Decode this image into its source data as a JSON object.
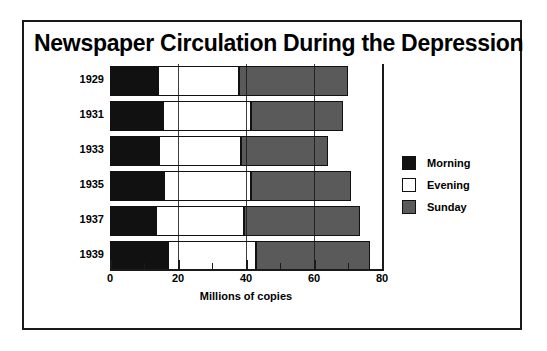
{
  "figure": {
    "title": "Newspaper Circulation During the Depression"
  },
  "legend": {
    "position": "right",
    "items": [
      {
        "label": "Morning",
        "color": "#111111",
        "swatch": "morning"
      },
      {
        "label": "Evening",
        "color": "#ffffff",
        "swatch": "evening"
      },
      {
        "label": "Sunday",
        "color": "#5a5a5a",
        "swatch": "sunday"
      }
    ]
  },
  "axis": {
    "x_title": "Millions of copies",
    "tick_labels": [
      "0",
      "20",
      "40",
      "60",
      "80"
    ],
    "tick_values": [
      0,
      20,
      40,
      60,
      80
    ],
    "minor_tick_values": [
      10,
      30,
      50,
      70
    ]
  },
  "chart_data": {
    "type": "bar",
    "orientation": "horizontal",
    "stacked": true,
    "title": "Newspaper Circulation During the Depression",
    "xlabel": "Millions of copies",
    "ylabel": "",
    "xlim": [
      0,
      80
    ],
    "grid": false,
    "legend_position": "right",
    "categories": [
      "1929",
      "1931",
      "1933",
      "1935",
      "1937",
      "1939"
    ],
    "series": [
      {
        "name": "Morning",
        "color": "#111111",
        "values": [
          14.0,
          15.5,
          14.5,
          16.0,
          13.5,
          17.0
        ]
      },
      {
        "name": "Evening",
        "color": "#ffffff",
        "values": [
          24.0,
          26.0,
          24.0,
          25.5,
          26.0,
          26.0
        ]
      },
      {
        "name": "Sunday",
        "color": "#5a5a5a",
        "values": [
          32.0,
          27.0,
          25.5,
          29.5,
          34.0,
          33.5
        ]
      }
    ],
    "totals": [
      70.0,
      68.5,
      64.0,
      71.0,
      73.5,
      76.5
    ]
  },
  "rows": [
    {
      "year": "1929",
      "morning": 14.0,
      "evening": 24.0,
      "sunday": 32.0
    },
    {
      "year": "1931",
      "morning": 15.5,
      "evening": 26.0,
      "sunday": 27.0
    },
    {
      "year": "1933",
      "morning": 14.5,
      "evening": 24.0,
      "sunday": 25.5
    },
    {
      "year": "1935",
      "morning": 16.0,
      "evening": 25.5,
      "sunday": 29.5
    },
    {
      "year": "1937",
      "morning": 13.5,
      "evening": 26.0,
      "sunday": 34.0
    },
    {
      "year": "1939",
      "morning": 17.0,
      "evening": 26.0,
      "sunday": 33.5
    }
  ]
}
